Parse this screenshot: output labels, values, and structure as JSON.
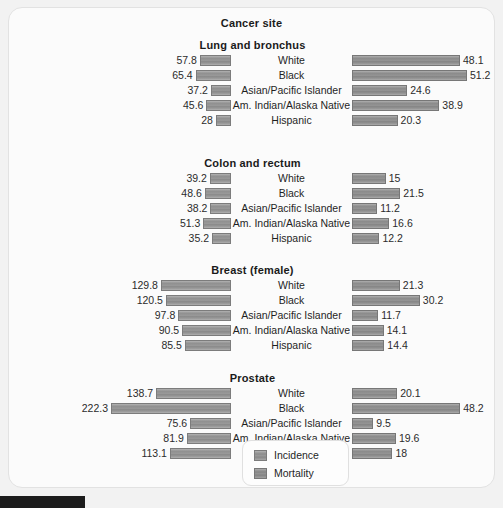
{
  "chart_data": {
    "type": "bar",
    "subtype": "bidirectional-population-pyramid",
    "title": "Cancer site",
    "xlabel": "",
    "ylabel": "",
    "grid": false,
    "legend_position": "bottom-center",
    "left_direction_label": "Incidence",
    "right_direction_label": "Mortality",
    "categories": [
      "White",
      "Black",
      "Asian/Pacific Islander",
      "Am. Indian/Alaska Native",
      "Hispanic"
    ],
    "left_axis_max": 222.3,
    "right_axis_max": 51.2,
    "groups": [
      {
        "name": "Lung and bronchus",
        "rows": [
          {
            "category": "White",
            "incidence": 57.8,
            "mortality": 48.1
          },
          {
            "category": "Black",
            "incidence": 65.4,
            "mortality": 51.2
          },
          {
            "category": "Asian/Pacific Islander",
            "incidence": 37.2,
            "mortality": 24.6
          },
          {
            "category": "Am. Indian/Alaska Native",
            "incidence": 45.6,
            "mortality": 38.9
          },
          {
            "category": "Hispanic",
            "incidence": 28,
            "mortality": 20.3
          }
        ]
      },
      {
        "name": "Colon and rectum",
        "rows": [
          {
            "category": "White",
            "incidence": 39.2,
            "mortality": 15
          },
          {
            "category": "Black",
            "incidence": 48.6,
            "mortality": 21.5
          },
          {
            "category": "Asian/Pacific Islander",
            "incidence": 38.2,
            "mortality": 11.2
          },
          {
            "category": "Am. Indian/Alaska Native",
            "incidence": 51.3,
            "mortality": 16.6
          },
          {
            "category": "Hispanic",
            "incidence": 35.2,
            "mortality": 12.2
          }
        ]
      },
      {
        "name": "Breast (female)",
        "rows": [
          {
            "category": "White",
            "incidence": 129.8,
            "mortality": 21.3
          },
          {
            "category": "Black",
            "incidence": 120.5,
            "mortality": 30.2
          },
          {
            "category": "Asian/Pacific Islander",
            "incidence": 97.8,
            "mortality": 11.7
          },
          {
            "category": "Am. Indian/Alaska Native",
            "incidence": 90.5,
            "mortality": 14.1
          },
          {
            "category": "Hispanic",
            "incidence": 85.5,
            "mortality": 14.4
          }
        ]
      },
      {
        "name": "Prostate",
        "rows": [
          {
            "category": "White",
            "incidence": 138.7,
            "mortality": 20.1
          },
          {
            "category": "Black",
            "incidence": 222.3,
            "mortality": 48.2
          },
          {
            "category": "Asian/Pacific Islander",
            "incidence": 75.6,
            "mortality": 9.5
          },
          {
            "category": "Am. Indian/Alaska Native",
            "incidence": 81.9,
            "mortality": 19.6
          },
          {
            "category": "Hispanic",
            "incidence": 113.1,
            "mortality": 18
          }
        ]
      }
    ],
    "legend": [
      {
        "label": "Incidence",
        "color": "#959595"
      },
      {
        "label": "Mortality",
        "color": "#8e8e8e"
      }
    ]
  },
  "panel": {
    "background": "#fbfbfb",
    "border_color": "#e2e2e2"
  }
}
